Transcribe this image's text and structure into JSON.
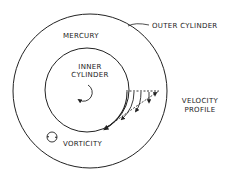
{
  "diagram": {
    "labels": {
      "outer_cylinder": "OUTER CYLINDER",
      "mercury": "MERCURY",
      "inner_cylinder_1": "INNER",
      "inner_cylinder_2": "CYLINDER",
      "velocity_profile_1": "VELOCITY",
      "velocity_profile_2": "PROFILE",
      "vorticity": "VORTICITY"
    },
    "colors": {
      "stroke": "#222222",
      "background": "#ffffff"
    }
  }
}
